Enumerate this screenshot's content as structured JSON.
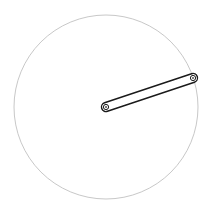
{
  "diagram": {
    "type": "crank-link",
    "canvas": {
      "width": 209,
      "height": 211,
      "background": "#ffffff"
    },
    "circle": {
      "cx": 106,
      "cy": 107,
      "r": 92,
      "stroke": "#c8c8c8"
    },
    "link": {
      "x1": 106,
      "y1": 107,
      "x2": 193,
      "y2": 78,
      "width": 9,
      "stroke": "#1a1a1a",
      "fill": "#ffffff"
    },
    "pivots": [
      {
        "name": "center-pivot",
        "cx": 106,
        "cy": 107
      },
      {
        "name": "end-pivot",
        "cx": 193,
        "cy": 78
      }
    ]
  }
}
